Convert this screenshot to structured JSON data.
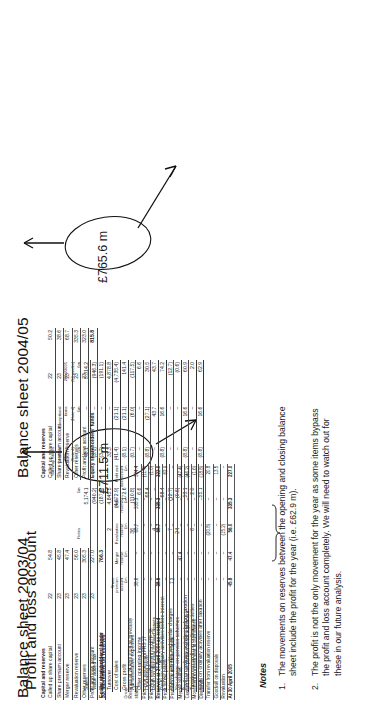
{
  "page": {
    "pl_title": "Profit and loss account",
    "bs2005_title": "Balance sheet 2004/05",
    "bs2004_title": "Balance sheet 2003/04",
    "notes_title": "Notes"
  },
  "pl": {
    "columns": [
      {
        "key": "notes",
        "label": "Notes"
      },
      {
        "key": "c1",
        "label": "£m"
      },
      {
        "key": "c2",
        "label": "Safeway Stores\nSouthern\nClosure\n(Note 4)\n£m"
      },
      {
        "key": "c3",
        "label": "Exceptional\nitems\n(Note 4)\n£m"
      },
      {
        "key": "c4",
        "label": "2004/2005\n(53 weeks)\n£m"
      }
    ],
    "rows": [
      {
        "label": "Sales",
        "notes": "",
        "c1": "5,174.1",
        "c2": "48.1",
        "c3": "–",
        "c4": "5,314.2",
        "bold": true,
        "rule": false
      },
      {
        "label": "Value added tax",
        "notes": "",
        "c1": "(940.2)",
        "c2": "(3.1)",
        "c3": "–",
        "c4": "(946.3)",
        "bold": false,
        "rule": false
      },
      {
        "label": "Net retail partner turnover",
        "notes": "",
        "c1": "(187.4)",
        "c2": "(3.7)",
        "c3": "–",
        "c4": "(191.1)",
        "bold": false,
        "rule": true
      },
      {
        "label": "Turnover",
        "notes": "2",
        "c1": "4,845.5",
        "c2": "33.3",
        "c3": "–",
        "c4": "4,878.8",
        "bold": true,
        "rule": true
      },
      {
        "label": "Cost of sales",
        "notes": "",
        "c1": "(4,672.9)",
        "c2": "(41.4)",
        "c3": "(21.1)",
        "c4": "(4,735.4)",
        "bold": false,
        "rule": true
      },
      {
        "label": "Gross profit",
        "notes": "",
        "c1": "172.6",
        "c2": "(8.1)",
        "c3": "(21.1)",
        "c4": "141.4",
        "bold": true,
        "rule": true
      },
      {
        "label": "Administrative expenses",
        "notes": "36",
        "c1": "(110.8)",
        "c2": "(0.7)",
        "c3": "(6.0)",
        "c4": "(117.5)",
        "bold": false,
        "rule": false
      },
      {
        "label": "Other operating income",
        "notes": "",
        "c1": "6.6",
        "c2": "–",
        "c3": "–",
        "c4": "6.6",
        "bold": false,
        "rule": true
      },
      {
        "label": "Operating profit",
        "notes": "",
        "c1": "68.4",
        "c2": "(8.8)",
        "c3": "(27.1)",
        "c4": "30.5",
        "bold": true,
        "rule": false
      },
      {
        "label": "Profit on disposal of fixed assets",
        "notes": "4",
        "c1": "–",
        "c2": "–",
        "c3": "43.7",
        "c4": "43.7",
        "bold": false,
        "rule": true
      },
      {
        "label": "Profit on ordinary activities before interest",
        "notes": "",
        "c1": "68.4",
        "c2": "(8.8)",
        "c3": "16.6",
        "c4": "74.2",
        "bold": true,
        "rule": true
      },
      {
        "label": "Interest payable and similar charges",
        "notes": "7",
        "c1": "(12.7)",
        "c2": "–",
        "c3": "–",
        "c4": "(12.7)",
        "bold": false,
        "rule": false
      },
      {
        "label": "Net charge on pension schemes",
        "notes": "24",
        "c1": "(0.6)",
        "c2": "–",
        "c3": "–",
        "c4": "(0.6)",
        "bold": false,
        "rule": true
      },
      {
        "label": "Profit on ordinary activities before taxation",
        "notes": "",
        "c1": "53.1",
        "c2": "(8.8)",
        "c3": "16.6",
        "c4": "60.9",
        "bold": true,
        "rule": false
      },
      {
        "label": "Taxation on profit on ordinary activities",
        "notes": "8",
        "c1": "2.0",
        "c2": "–",
        "c3": "–",
        "c4": "2.0",
        "bold": false,
        "rule": true
      },
      {
        "label": "Profit on ordinary activities after taxation",
        "notes": "",
        "c1": "55.1",
        "c2": "(8.8)",
        "c3": "16.6",
        "c4": "62.9",
        "bold": true,
        "rule": true
      }
    ]
  },
  "bs2005": {
    "section_label": "Capital and reserves",
    "rows": [
      {
        "label": "Called up share capital",
        "note": "22",
        "value": "50.2",
        "bold": false
      },
      {
        "label": "Share premium account",
        "note": "23",
        "value": "38.6",
        "bold": false
      },
      {
        "label": "Revaluation reserve",
        "note": "23",
        "value": "68.7",
        "bold": false
      },
      {
        "label": "Other reserves",
        "note": "23",
        "value": "335.3",
        "bold": false
      },
      {
        "label": "Profit and loss account",
        "note": "23",
        "value": "323.0",
        "bold": false
      },
      {
        "label": "Equity shareholders' funds",
        "note": "",
        "value": "815.8",
        "bold": true
      }
    ]
  },
  "bs2004": {
    "section_label": "Capital and reserves",
    "rows": [
      {
        "label": "Called up share capital",
        "note": "22",
        "value": "54.8",
        "bold": false
      },
      {
        "label": "Share premium account",
        "note": "23",
        "value": "45.8",
        "bold": false
      },
      {
        "label": "Merger reserve",
        "note": "23",
        "value": "47.4",
        "bold": false
      },
      {
        "label": "Revaluation reserve",
        "note": "23",
        "value": "56.0",
        "bold": false
      },
      {
        "label": "Other reserves",
        "note": "23",
        "value": "305.3",
        "bold": false
      },
      {
        "label": "Profit and loss account",
        "note": "23",
        "value": "227.0",
        "bold": false
      },
      {
        "label": "Equity shareholders' funds",
        "note": "",
        "value": "766.3",
        "bold": true
      }
    ]
  },
  "movement": {
    "heading": "33. Movement on reserves",
    "group_label": "Group",
    "columns": [
      {
        "label": "Share premium\naccount\n£m"
      },
      {
        "label": "Merger\nreserve\n£m"
      },
      {
        "label": "Revaluation\nreserve\n£m"
      },
      {
        "label": "Other\nreserves\n£m"
      },
      {
        "label": "Profit and\nloss account\n£m"
      }
    ],
    "rows": [
      {
        "label": "Reserves at 24 April 2004 as previously stated",
        "c1": "38.6",
        "c2": "–",
        "c3": "68.7",
        "c4": "335.3",
        "c5": "334.4",
        "rule": false,
        "bold": false
      },
      {
        "label": "Prior year restatement FRS 17",
        "c1": "–",
        "c2": "–",
        "c3": "–",
        "c4": "–",
        "c5": "(11.4)",
        "rule": true,
        "bold": false
      },
      {
        "label": "Prior year restatement for UITF 38",
        "c1": "–",
        "c2": "–",
        "c3": "–",
        "c4": "–",
        "c5": "(1.0)",
        "rule": true,
        "bold": false
      },
      {
        "label": "Reserves at 24 April 2004 as restated",
        "c1": "38.6",
        "c2": "–",
        "c3": "68.7",
        "c4": "335.3",
        "c5": "322.0",
        "rule": true,
        "bold": true
      },
      {
        "label": "Profit for the period",
        "c1": "–",
        "c2": "–",
        "c3": "–",
        "c4": "–",
        "c5": "62.9",
        "rule": false,
        "bold": false
      },
      {
        "label": "Premium on new share capital",
        "c1": "7.2",
        "c2": "–",
        "c3": "–",
        "c4": "–",
        "c5": "–",
        "rule": false,
        "bold": false
      },
      {
        "label": "Merger reserve",
        "c1": "–",
        "c2": "47.4",
        "c3": "–",
        "c4": "–",
        "c5": "(47.4)",
        "rule": false,
        "bold": false
      },
      {
        "label": "Current year net pension deficit adjustment",
        "c1": "–",
        "c2": "–",
        "c3": "–",
        "c4": "–",
        "c5": "(46.2)",
        "rule": false,
        "bold": false
      },
      {
        "label": "Movement in investment in own shares",
        "c1": "–",
        "c2": "–",
        "c3": "–",
        "c4": "–",
        "c5": "(1.6)",
        "rule": false,
        "bold": false
      },
      {
        "label": "Dividends",
        "c1": "–",
        "c2": "–",
        "c3": "–",
        "c4": "–",
        "c5": "(18.8)",
        "rule": false,
        "bold": false
      },
      {
        "label": "Transfer from revaluation reserve",
        "c1": "–",
        "c2": "–",
        "c3": "(20.8)",
        "c4": "–",
        "c5": "20.8",
        "rule": false,
        "bold": false
      },
      {
        "label": "Goodwill on disposals",
        "c1": "–",
        "c2": "–",
        "c3": "–",
        "c4": "–",
        "c5": "13.5",
        "rule": false,
        "bold": false
      },
      {
        "label": "Revaluation",
        "c1": "–",
        "c2": "–",
        "c3": "(15.2)",
        "c4": "–",
        "c5": "–",
        "rule": true,
        "bold": false
      },
      {
        "label": "At 30 April 2005",
        "c1": "45.8",
        "c2": "47.4",
        "c3": "56.0",
        "c4": "335.3",
        "c5": "227.0",
        "rule": true,
        "bold": true
      }
    ]
  },
  "annotations": {
    "callout_top": "£765.6 m",
    "callout_bottom": "£711.5 m"
  },
  "notes": {
    "title": "Notes",
    "items": [
      {
        "n": "1.",
        "text": "The movements on reserves between the opening and closing balance sheet include the profit for the year (i.e. £62.9 m)."
      },
      {
        "n": "2.",
        "text": "The profit is not the only movement for the year as some items bypass the profit and loss account completely. We will need to watch out for these in our future analysis."
      }
    ]
  }
}
